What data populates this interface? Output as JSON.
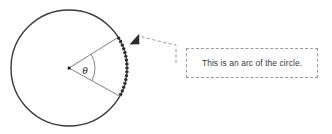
{
  "figure": {
    "background_color": "#ffffff",
    "circle": {
      "name": "circle-outline",
      "center_x": 69,
      "center_y": 68,
      "radius": 58,
      "stroke_color": "#3a3a3a",
      "stroke_width": 1.4
    },
    "center_point": {
      "name": "circle-center-dot",
      "x": 69,
      "y": 68,
      "color": "#1a1a1a",
      "size": 2.6
    },
    "radii": [
      {
        "name": "radius-upper",
        "angle_degrees": -32,
        "stroke_color": "#6b6b6b",
        "stroke_width": 0.8
      },
      {
        "name": "radius-lower",
        "angle_degrees": 29,
        "stroke_color": "#6b6b6b",
        "stroke_width": 0.8
      }
    ],
    "angle": {
      "name": "central-angle",
      "symbol": "θ",
      "label_x": 88,
      "label_y": 74,
      "arc_radius": 26,
      "start_degrees": -32,
      "end_degrees": 29,
      "stroke_color": "#6b6b6b"
    },
    "highlighted_arc": {
      "name": "highlighted-arc",
      "start_degrees": -32,
      "end_degrees": 29,
      "stroke_color": "#2b2b2b",
      "stroke_width": 3.2,
      "dash_pattern": "2.2 1.6"
    },
    "leader": {
      "name": "callout-leader-line",
      "stroke_color": "#8a8a8a",
      "stroke_width": 0.9,
      "dash_pattern": "3 2.5",
      "points": [
        {
          "x": 176,
          "y": 62
        },
        {
          "x": 176,
          "y": 45
        },
        {
          "x": 158,
          "y": 41
        },
        {
          "x": 140,
          "y": 36
        }
      ],
      "arrow": {
        "name": "callout-arrowhead",
        "tip_x": 129,
        "tip_y": 44,
        "color": "#2b2b2b"
      }
    }
  },
  "callout": {
    "name": "callout-box",
    "text": "This is an arc of the circle.",
    "border_color": "#9a9a9a",
    "border_style": "dashed",
    "text_color": "#3d3d3d",
    "background_color": "#ffffff"
  }
}
